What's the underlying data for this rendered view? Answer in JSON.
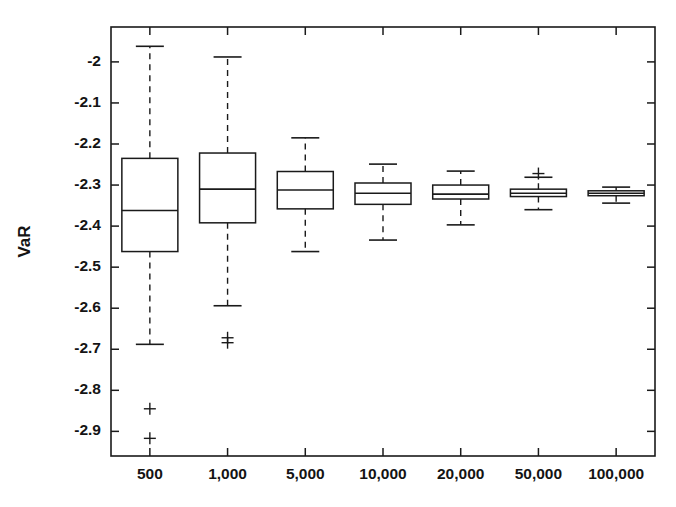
{
  "chart_data": {
    "type": "box",
    "title": "",
    "subtitle": "",
    "xlabel": "",
    "ylabel": "VaR",
    "categories": [
      "500",
      "1,000",
      "5,000",
      "10,000",
      "20,000",
      "50,000",
      "100,000"
    ],
    "ytick_labels": [
      "-2",
      "-2.1",
      "-2.2",
      "-2.3",
      "-2.4",
      "-2.5",
      "-2.6",
      "-2.7",
      "-2.8",
      "-2.9"
    ],
    "ytick_values": [
      -2.0,
      -2.1,
      -2.2,
      -2.3,
      -2.4,
      -2.5,
      -2.6,
      -2.7,
      -2.8,
      -2.9
    ],
    "ylim": [
      -2.96,
      -1.915
    ],
    "grid": false,
    "legend": "none",
    "outlier_marker": "+",
    "whisker_style": "dashed",
    "boxes": [
      {
        "category": "500",
        "whisker_high": -1.962,
        "q3": -2.235,
        "median": -2.362,
        "q1": -2.462,
        "whisker_low": -2.688,
        "outliers": [
          -2.845,
          -2.917
        ]
      },
      {
        "category": "1,000",
        "whisker_high": -1.988,
        "q3": -2.222,
        "median": -2.31,
        "q1": -2.392,
        "whisker_low": -2.594,
        "outliers": [
          -2.672,
          -2.684
        ]
      },
      {
        "category": "5,000",
        "whisker_high": -2.185,
        "q3": -2.267,
        "median": -2.312,
        "q1": -2.358,
        "whisker_low": -2.462,
        "outliers": []
      },
      {
        "category": "10,000",
        "whisker_high": -2.249,
        "q3": -2.295,
        "median": -2.32,
        "q1": -2.347,
        "whisker_low": -2.434,
        "outliers": []
      },
      {
        "category": "20,000",
        "whisker_high": -2.266,
        "q3": -2.3,
        "median": -2.322,
        "q1": -2.334,
        "whisker_low": -2.397,
        "outliers": []
      },
      {
        "category": "50,000",
        "whisker_high": -2.281,
        "q3": -2.31,
        "median": -2.32,
        "q1": -2.328,
        "whisker_low": -2.36,
        "outliers": [
          -2.272
        ]
      },
      {
        "category": "100,000",
        "whisker_high": -2.305,
        "q3": -2.314,
        "median": -2.32,
        "q1": -2.326,
        "whisker_low": -2.344,
        "outliers": []
      }
    ]
  },
  "layout": {
    "plot_left": 111,
    "plot_right": 655,
    "plot_top": 27,
    "plot_bottom": 456,
    "box_half_width": 28,
    "cap_half_width": 14,
    "outlier_half": 6,
    "axis_color": "#1a1a1a",
    "background": "#ffffff"
  }
}
